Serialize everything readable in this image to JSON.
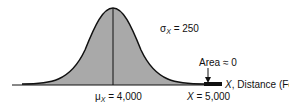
{
  "diagram": {
    "type": "normal-distribution",
    "mean_label": {
      "symbol": "μ",
      "sub": "X",
      "value": "= 4,000"
    },
    "sigma_label": {
      "symbol": "σ",
      "sub": "X",
      "value": "= 250"
    },
    "x_label": {
      "symbol": "X",
      "value": "= 5,000"
    },
    "axis_label": {
      "symbol": "X",
      "text": ", Distance (Feet)"
    },
    "area_label": "Area ≈ 0",
    "colors": {
      "fill": "#a9a9a9",
      "line": "#111111"
    }
  }
}
